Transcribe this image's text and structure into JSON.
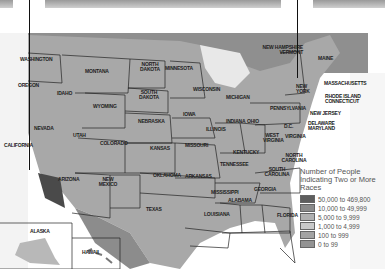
{
  "map": {
    "title": "Number of People Indicating Two or More Races",
    "legend": {
      "title": "Number of People Indicating Two or More Races",
      "items": [
        {
          "label": "50,000 to 469,800",
          "color": "#5e5e5e"
        },
        {
          "label": "10,000 to 49,999",
          "color": "#8a8a8a"
        },
        {
          "label": "5,000 to 9,999",
          "color": "#b0b0b0"
        },
        {
          "label": "1,000 to 4,999",
          "color": "#c9c9c9"
        },
        {
          "label": "100 to 999",
          "color": "#a3a3a3"
        },
        {
          "label": "0 to 99",
          "color": "#939393"
        }
      ]
    },
    "states": {
      "washington": "WASHINGTON",
      "oregon": "OREGON",
      "idaho": "IDAHO",
      "montana": "MONTANA",
      "wyoming": "WYOMING",
      "north_dakota": "NORTH DAKOTA",
      "south_dakota": "SOUTH DAKOTA",
      "minnesota": "MINNESOTA",
      "wisconsin": "WISCONSIN",
      "michigan": "MICHIGAN",
      "nebraska": "NEBRASKA",
      "iowa": "IOWA",
      "illinois": "ILLINOIS",
      "indiana": "INDIANA",
      "ohio": "OHIO",
      "pennsylvania": "PENNSYLVANIA",
      "new_york": "NEW YORK",
      "nh_vt": "NEW HAMPSHIRE VERMONT",
      "maine": "MAINE",
      "massachusetts": "MASSACHUSETTS",
      "ri_ct": "RHODE ISLAND CONNECTICUT",
      "new_jersey": "NEW JERSEY",
      "de_md": "DELAWARE MARYLAND",
      "dc": "D.C.",
      "virginia": "VIRGINIA",
      "west_virginia": "WEST VIRGINIA",
      "california": "CALIFORNIA",
      "nevada": "NEVADA",
      "utah": "UTAH",
      "colorado": "COLORADO",
      "kansas": "KANSAS",
      "missouri": "MISSOURI",
      "kentucky": "KENTUCKY",
      "tennessee": "TENNESSEE",
      "north_carolina": "NORTH CAROLINA",
      "south_carolina": "SOUTH CAROLINA",
      "arizona": "ARIZONA",
      "new_mexico": "NEW MEXICO",
      "oklahoma": "OKLAHOMA",
      "arkansas": "ARKANSAS",
      "mississippi": "MISSISSIPPI",
      "alabama": "ALABAMA",
      "georgia": "GEORGIA",
      "texas": "TEXAS",
      "louisiana": "LOUISIANA",
      "florida": "FLORIDA",
      "alaska": "ALASKA",
      "hawaii": "HAWAII"
    }
  }
}
